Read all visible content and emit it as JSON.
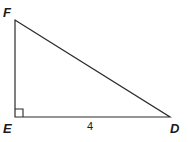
{
  "figure": {
    "type": "right-triangle",
    "background_color": "#ffffff",
    "stroke_color": "#2b2b2b",
    "stroke_width": 1.2,
    "text_color": "#1a1a1a",
    "vertices": [
      {
        "name": "F",
        "label": "F",
        "x": 15,
        "y": 20
      },
      {
        "name": "E",
        "label": "E",
        "x": 15,
        "y": 117
      },
      {
        "name": "D",
        "label": "D",
        "x": 170,
        "y": 117
      }
    ],
    "labels": {
      "vertex_f": "F",
      "vertex_e": "E",
      "vertex_d": "D"
    },
    "sides": [
      {
        "name": "ED",
        "label": "4",
        "from": "E",
        "to": "D"
      },
      {
        "name": "EF",
        "label": "",
        "from": "E",
        "to": "F"
      },
      {
        "name": "FD",
        "label": "",
        "from": "F",
        "to": "D"
      }
    ],
    "side_labels": {
      "ed_length": "4"
    },
    "right_angle": {
      "at_vertex": "E",
      "marker_size": 8
    },
    "polygon_points": "15,20 15,117 170,117",
    "right_angle_points": "15,109 23,109 23,117"
  }
}
